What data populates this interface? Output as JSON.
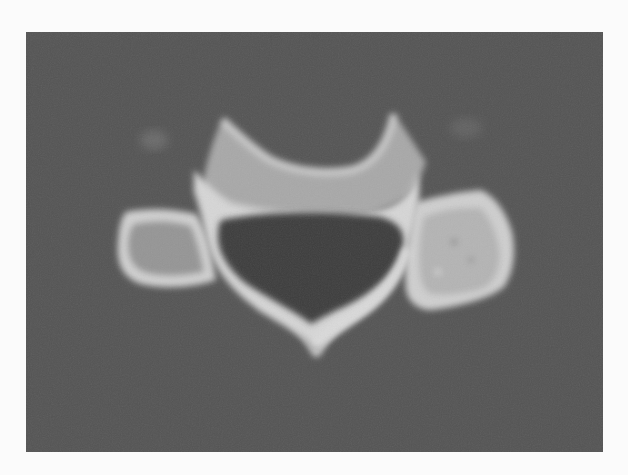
{
  "image": {
    "kind": "axial CT slice",
    "subject": "cervical vertebra",
    "background_color": "#fbfbfb",
    "frame_color": "#545454",
    "bone_color": "#d8d8d8",
    "bone_inner_color": "#9a9a9a",
    "canal_color": "#3e3e3e",
    "frame": {
      "x": 26,
      "y": 32,
      "width": 577,
      "height": 420
    }
  },
  "structures": [
    {
      "name": "vertebral-body",
      "label": ""
    },
    {
      "name": "spinal-canal",
      "label": ""
    },
    {
      "name": "left-transverse-process",
      "label": ""
    },
    {
      "name": "right-lateral-mass",
      "label": ""
    },
    {
      "name": "spinous-process",
      "label": ""
    }
  ]
}
